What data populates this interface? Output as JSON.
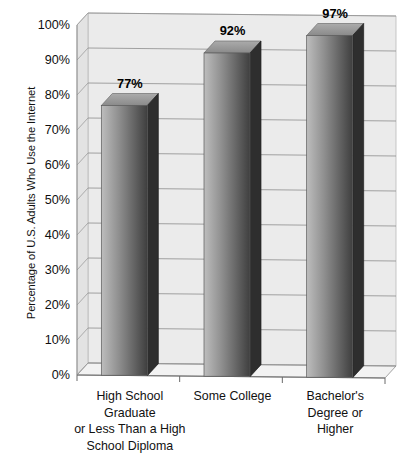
{
  "chart_data": {
    "type": "bar",
    "title": "",
    "subtitle": "",
    "xlabel": "",
    "ylabel": "Percentage of U.S. Adults Who Use the Internet",
    "ylim": [
      0,
      100
    ],
    "grid": true,
    "legend": "none",
    "style": "3d-bar",
    "categories": [
      "High School Graduate or Less Than a High School Diploma",
      "Some College",
      "Bachelor's Degree or Higher"
    ],
    "category_lines": [
      [
        "High School",
        "Graduate",
        "or Less Than a High",
        "School Diploma"
      ],
      [
        "Some College"
      ],
      [
        "Bachelor's",
        "Degree or",
        "Higher"
      ]
    ],
    "values": [
      77,
      92,
      97
    ],
    "value_labels": [
      "77%",
      "92%",
      "97%"
    ],
    "y_ticks": [
      0,
      10,
      20,
      30,
      40,
      50,
      60,
      70,
      80,
      90,
      100
    ],
    "y_tick_labels": [
      "0%",
      "10%",
      "20%",
      "30%",
      "40%",
      "50%",
      "60%",
      "70%",
      "80%",
      "90%",
      "100%"
    ]
  },
  "colors": {
    "wall": "#ebebeb",
    "wall_edge": "#b9b9b9",
    "floor": "#f2f2f2",
    "floor_edge": "#9a9a9a",
    "gridline": "#8d8d8d",
    "bar_front_light": "#bdbdbd",
    "bar_front_dark": "#3f3f3f",
    "bar_side": "#2e2e2e",
    "bar_top": "#9b9b9b",
    "text": "#111111"
  }
}
